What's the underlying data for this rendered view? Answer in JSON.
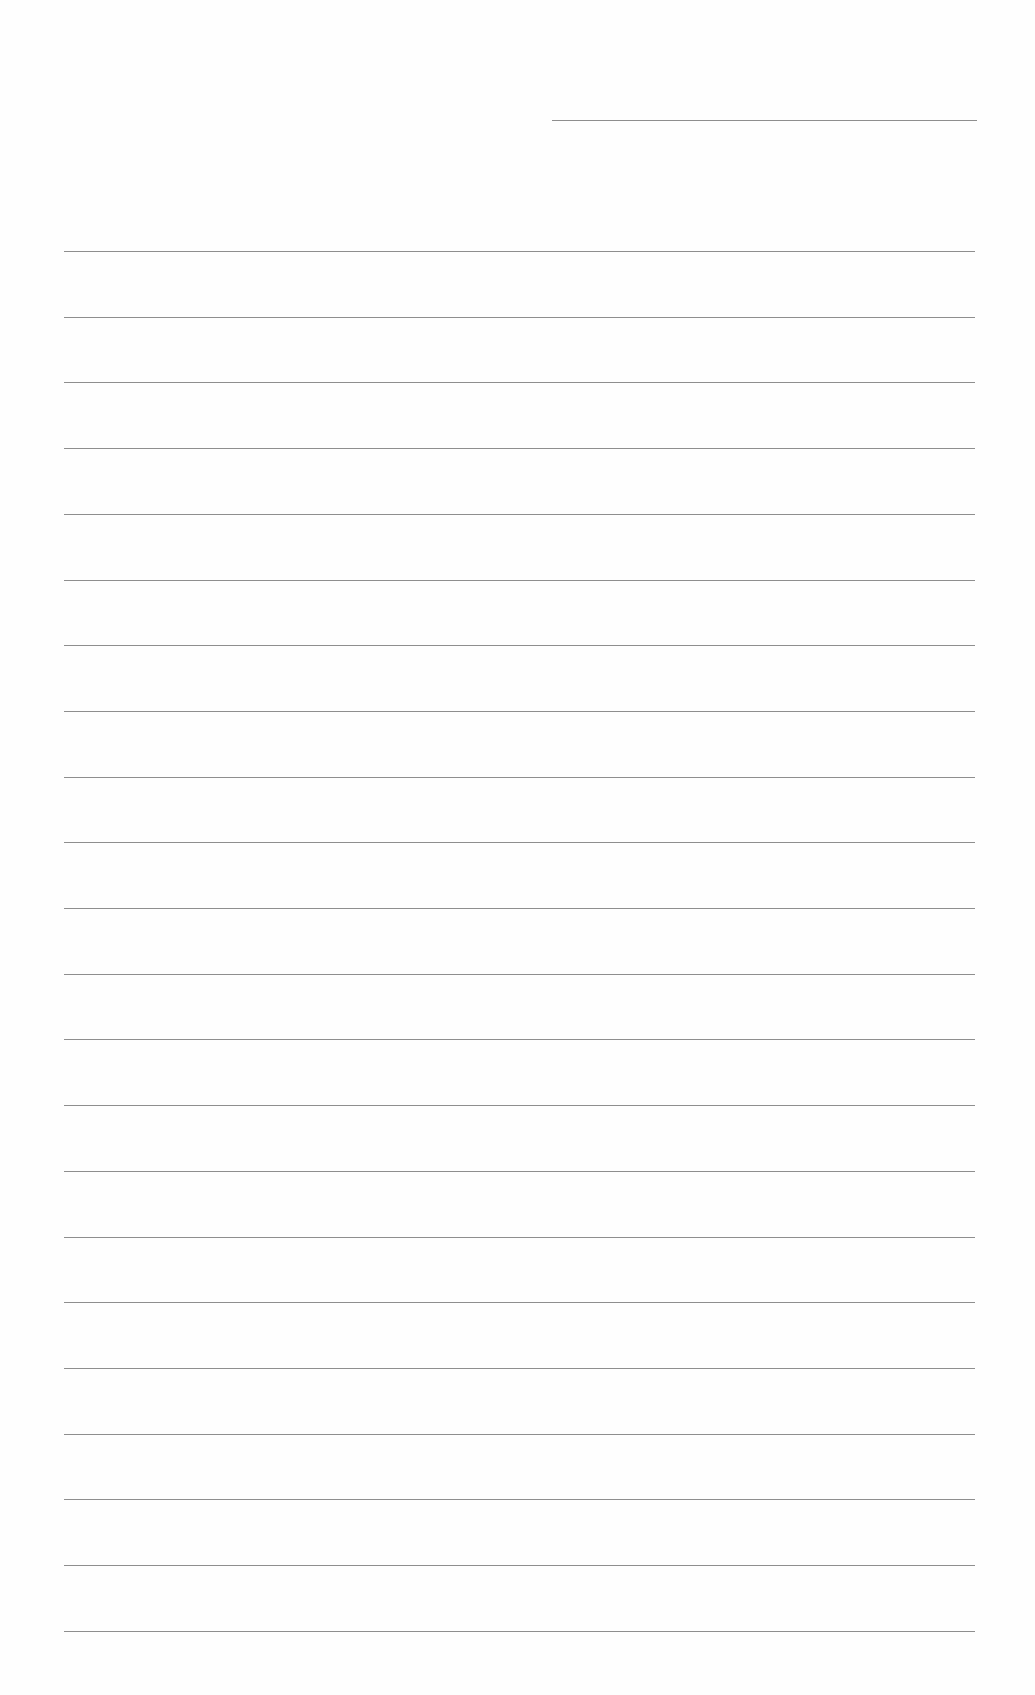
{
  "document": {
    "type": "blank lined sheet",
    "background_color": "#fefefe",
    "line_color": "#8e8e8e",
    "header_rule": {
      "x_start": 552,
      "x_end": 977,
      "y": 120
    },
    "body_rules": {
      "count": 22,
      "x_start": 64,
      "x_end": 975,
      "first_y": 251,
      "spacing": 65.7
    }
  }
}
